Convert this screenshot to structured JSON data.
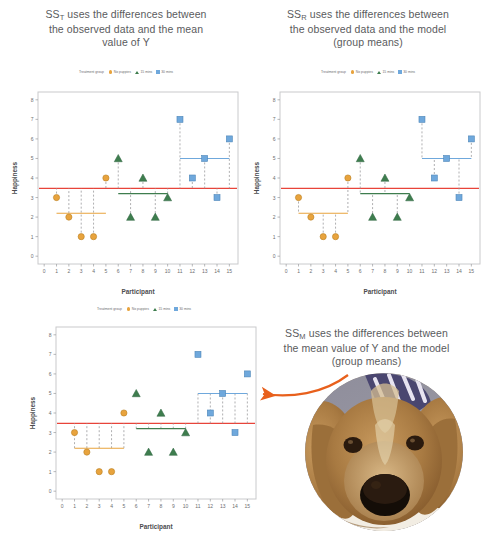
{
  "figure": {
    "panels": [
      {
        "id": "sst",
        "caption_lines": [
          "SS",
          "T",
          " uses the differences between",
          "the observed data and the mean",
          "value of Y"
        ],
        "caption_prefix": "SS",
        "caption_sub": "T",
        "caption_rest": " uses the differences between",
        "caption_line2": "the observed data and the mean",
        "caption_line3": "value of Y"
      },
      {
        "id": "ssr",
        "caption_prefix": "SS",
        "caption_sub": "R",
        "caption_rest": " uses the differences between",
        "caption_line2": "the observed data and the model",
        "caption_line3": "(group means)"
      },
      {
        "id": "ssm",
        "caption_prefix": "SS",
        "caption_sub": "M",
        "caption_rest": " uses the differences between",
        "caption_line2": "the mean value of Y and the model",
        "caption_line3": "(group means)"
      }
    ]
  },
  "legend": {
    "title": "Treatment group",
    "items": [
      {
        "label": "No puppies",
        "marker": "circle-marker",
        "color": "#E8A33D"
      },
      {
        "label": "15 mins",
        "marker": "triangle-marker",
        "color": "#3E7D4E"
      },
      {
        "label": "30 mins",
        "marker": "square-marker",
        "color": "#6FA8DC"
      }
    ]
  },
  "chart_data": {
    "type": "scatter",
    "xlabel": "Participant",
    "ylabel": "Happiness",
    "xlim": [
      -0.5,
      15.7
    ],
    "ylim": [
      -0.4,
      8.4
    ],
    "xticks": [
      0,
      1,
      2,
      3,
      4,
      5,
      6,
      7,
      8,
      9,
      10,
      11,
      12,
      13,
      14,
      15
    ],
    "yticks": [
      0,
      1,
      2,
      3,
      4,
      5,
      6,
      7,
      8
    ],
    "grid": false,
    "legend_position": "top-center",
    "grand_mean": 3.47,
    "grand_mean_color": "#E8443A",
    "groups": [
      {
        "name": "No puppies",
        "marker": "circle",
        "color": "#E8A33D",
        "mean": 2.2,
        "x_from": 1,
        "x_to": 5,
        "points": [
          {
            "x": 1,
            "y": 3
          },
          {
            "x": 2,
            "y": 2
          },
          {
            "x": 3,
            "y": 1
          },
          {
            "x": 4,
            "y": 1
          },
          {
            "x": 5,
            "y": 4
          }
        ]
      },
      {
        "name": "15 mins",
        "marker": "triangle",
        "color": "#3E7D4E",
        "mean": 3.2,
        "x_from": 6,
        "x_to": 10,
        "points": [
          {
            "x": 6,
            "y": 5
          },
          {
            "x": 7,
            "y": 2
          },
          {
            "x": 8,
            "y": 4
          },
          {
            "x": 9,
            "y": 2
          },
          {
            "x": 10,
            "y": 3
          }
        ]
      },
      {
        "name": "30 mins",
        "marker": "square",
        "color": "#6FA8DC",
        "mean": 5.0,
        "x_from": 11,
        "x_to": 15,
        "points": [
          {
            "x": 11,
            "y": 7
          },
          {
            "x": 12,
            "y": 4
          },
          {
            "x": 13,
            "y": 5
          },
          {
            "x": 14,
            "y": 3
          },
          {
            "x": 15,
            "y": 6
          }
        ]
      }
    ],
    "panel_notes": [
      {
        "id": "sst",
        "deviation_from": "grand_mean",
        "description": "Dashed lines connect each observed point to the grand mean of Y"
      },
      {
        "id": "ssr",
        "deviation_from": "group_mean",
        "description": "Dashed lines connect each observed point to its group mean"
      },
      {
        "id": "ssm",
        "deviation_from": "group_mean_to_grand_mean",
        "description": "Dashed lines connect each group mean to the grand mean of Y"
      }
    ]
  },
  "photo": {
    "alt": "dog-photo",
    "shape": "circle"
  },
  "arrow": {
    "name": "annotation-arrow",
    "color": "#E8601C",
    "direction": "left"
  }
}
